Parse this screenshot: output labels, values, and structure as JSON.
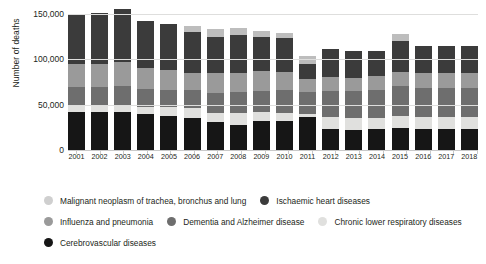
{
  "chart_data": {
    "type": "bar",
    "barmode": "stacked",
    "title": "",
    "xlabel": "",
    "ylabel": "Number of deaths",
    "ylim": [
      0,
      150000
    ],
    "yticks": [
      "0",
      "50,000",
      "100,000",
      "150,000"
    ],
    "ytick_values": [
      0,
      50000,
      100000,
      150000
    ],
    "grid": true,
    "legend_position": "bottom",
    "categories": [
      "2001",
      "2002",
      "2003",
      "2004",
      "2005",
      "2006",
      "2007",
      "2008",
      "2009",
      "2010",
      "2011",
      "2012",
      "2013",
      "2014",
      "2015",
      "2016",
      "2017",
      "2018"
    ],
    "series": [
      {
        "name": "Cerebrovascular diseases",
        "color": "#161616",
        "values": [
          41500,
          41500,
          42000,
          39500,
          38000,
          35500,
          30500,
          28000,
          32000,
          32500,
          36500,
          23500,
          22500,
          23000,
          24000,
          23000,
          23000,
          23000
        ]
      },
      {
        "name": "Chronic lower respiratory diseases",
        "color": "#e0e0de",
        "values": [
          8000,
          7500,
          8000,
          8000,
          9500,
          11000,
          10500,
          13000,
          9500,
          8000,
          3000,
          12500,
          12500,
          12500,
          13500,
          13000,
          13000,
          13000
        ]
      },
      {
        "name": "Dementia and Alzheimer disease",
        "color": "#6e6e6e",
        "values": [
          19500,
          20000,
          20500,
          20000,
          19000,
          19500,
          22000,
          22500,
          24000,
          25500,
          24000,
          29500,
          30000,
          30500,
          33000,
          32500,
          32500,
          32500
        ]
      },
      {
        "name": "Influenza and pneumonia",
        "color": "#9a9a9a",
        "values": [
          26000,
          25500,
          27000,
          22500,
          21500,
          19500,
          22000,
          22000,
          21500,
          20500,
          14500,
          15000,
          15000,
          15500,
          16000,
          16500,
          16500,
          16500
        ]
      },
      {
        "name": "Ischaemic heart diseases",
        "color": "#3b3b3b",
        "values": [
          55500,
          56500,
          58500,
          52500,
          51500,
          44500,
          40000,
          41000,
          38000,
          37000,
          16500,
          30500,
          29000,
          27500,
          33500,
          30000,
          30000,
          30000
        ]
      },
      {
        "name": "Malignant neoplasm of trachea, bronchus and lung",
        "color": "#bdbdbd",
        "values": [
          0,
          0,
          0,
          0,
          0,
          6500,
          8500,
          8500,
          6500,
          6000,
          9500,
          0,
          0,
          0,
          8500,
          0,
          0,
          0
        ]
      }
    ],
    "legend": [
      {
        "label": "Malignant neoplasm of trachea, bronchus and lung",
        "color": "#cfcfcf"
      },
      {
        "label": "Ischaemic heart diseases",
        "color": "#3b3b3b"
      },
      {
        "label": "Influenza and pneumonia",
        "color": "#9a9a9a"
      },
      {
        "label": "Dementia and Alzheimer disease",
        "color": "#6e6e6e"
      },
      {
        "label": "Chronic lower respiratory diseases",
        "color": "#e0e0de"
      },
      {
        "label": "Cerebrovascular diseases",
        "color": "#161616"
      }
    ]
  }
}
